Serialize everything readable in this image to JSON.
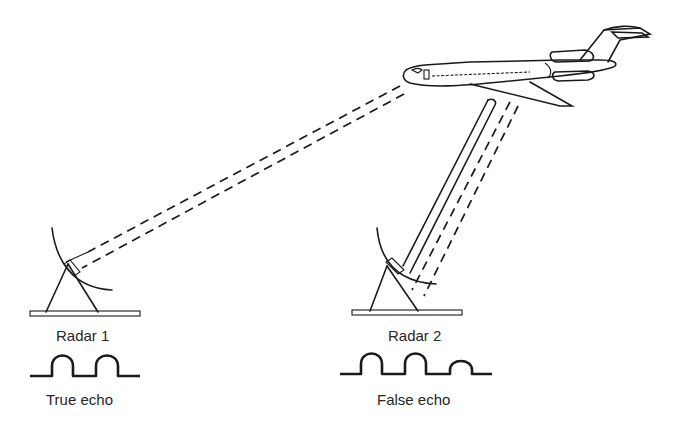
{
  "diagram": {
    "radar1": {
      "label": "Radar 1",
      "echo_label": "True echo",
      "pulses": 2
    },
    "radar2": {
      "label": "Radar 2",
      "echo_label": "False echo",
      "pulses": 3
    },
    "colors": {
      "ink": "#1a1a1a",
      "background": "#ffffff"
    }
  }
}
